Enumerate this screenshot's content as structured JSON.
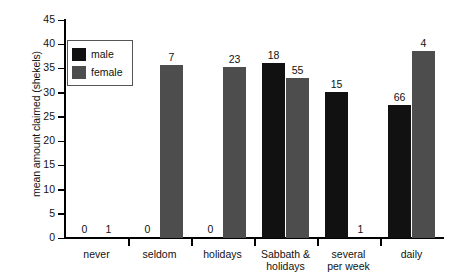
{
  "chart_data": {
    "type": "bar",
    "title": "",
    "subtitle": "",
    "xlabel": "",
    "ylabel": "mean amount claimed (shekels)",
    "ylim": [
      0,
      45
    ],
    "ytick_step": 5,
    "yticks": [
      "45",
      "40",
      "35",
      "30",
      "25",
      "20",
      "15",
      "10",
      "5",
      "0"
    ],
    "grid": false,
    "legend_position": "top-left-inside",
    "categories": [
      "never",
      "seldom",
      "holidays",
      "Sabbath & holidays",
      "several per week",
      "daily"
    ],
    "category_lines": [
      [
        "never"
      ],
      [
        "seldom"
      ],
      [
        "holidays"
      ],
      [
        "Sabbath &",
        "holidays"
      ],
      [
        "several",
        "per week"
      ],
      [
        "daily"
      ]
    ],
    "series": [
      {
        "name": "male",
        "color": "#111111",
        "values": [
          0,
          0,
          0,
          36.1,
          30.2,
          27.5
        ],
        "labels": [
          "0",
          "0",
          "0",
          "18",
          "15",
          "66"
        ]
      },
      {
        "name": "female",
        "color": "#4d4d4d",
        "values": [
          0,
          35.7,
          35.4,
          33.0,
          0,
          38.6
        ],
        "labels": [
          "1",
          "7",
          "23",
          "55",
          "1",
          "4"
        ]
      }
    ]
  },
  "legend": {
    "items": [
      {
        "label": "male",
        "swatch": "male"
      },
      {
        "label": "female",
        "swatch": "female"
      }
    ]
  },
  "axis": {
    "y_title": "mean amount claimed (shekels)"
  }
}
